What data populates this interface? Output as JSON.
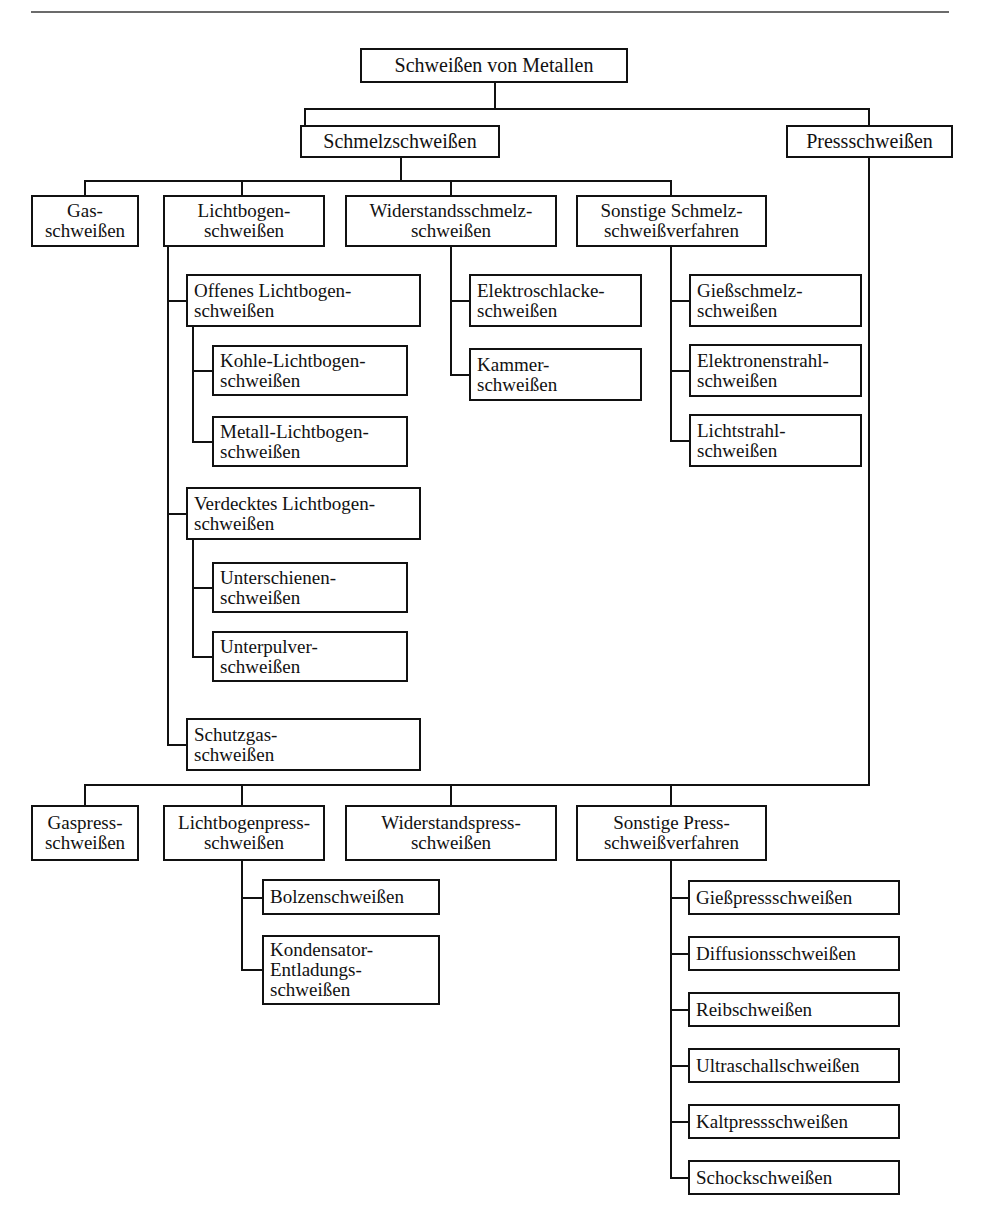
{
  "diagram": {
    "title_root": "Schweißen von Metallen",
    "type": "tree-hierarchy",
    "language": "de",
    "colors": {
      "line": "#111111",
      "box_border": "#111111",
      "background": "#ffffff",
      "rule": "#6b6b6b"
    },
    "nodes": {
      "root": {
        "label_lines": [
          "Schweißen von Metallen"
        ]
      },
      "schmelz": {
        "label_lines": [
          "Schmelzschweißen"
        ]
      },
      "press": {
        "label_lines": [
          "Pressschweißen"
        ]
      },
      "gas": {
        "label_lines": [
          "Gas-",
          "schweißen"
        ]
      },
      "lichtbogen": {
        "label_lines": [
          "Lichtbogen-",
          "schweißen"
        ]
      },
      "widerstandsschmelz": {
        "label_lines": [
          "Widerstandsschmelz-",
          "schweißen"
        ]
      },
      "sonstige_schmelz": {
        "label_lines": [
          "Sonstige Schmelz-",
          "schweißverfahren"
        ]
      },
      "offenes_lb": {
        "label_lines": [
          "Offenes Lichtbogen-",
          "schweißen"
        ]
      },
      "kohle_lb": {
        "label_lines": [
          "Kohle-Lichtbogen-",
          "schweißen"
        ]
      },
      "metall_lb": {
        "label_lines": [
          "Metall-Lichtbogen-",
          "schweißen"
        ]
      },
      "verdecktes_lb": {
        "label_lines": [
          "Verdecktes Lichtbogen-",
          "schweißen"
        ]
      },
      "unterschienen": {
        "label_lines": [
          "Unterschienen-",
          "schweißen"
        ]
      },
      "unterpulver": {
        "label_lines": [
          "Unterpulver-",
          "schweißen"
        ]
      },
      "schutzgas": {
        "label_lines": [
          "Schutzgas-",
          "schweißen"
        ]
      },
      "elektroschlacke": {
        "label_lines": [
          "Elektroschlacke-",
          "schweißen"
        ]
      },
      "kammer": {
        "label_lines": [
          "Kammer-",
          "schweißen"
        ]
      },
      "giessschmelz": {
        "label_lines": [
          "Gießschmelz-",
          "schweißen"
        ]
      },
      "elektronenstrahl": {
        "label_lines": [
          "Elektronenstrahl-",
          "schweißen"
        ]
      },
      "lichtstrahl": {
        "label_lines": [
          "Lichtstrahl-",
          "schweißen"
        ]
      },
      "gaspress": {
        "label_lines": [
          "Gaspress-",
          "schweißen"
        ]
      },
      "lichtbogenpress": {
        "label_lines": [
          "Lichtbogenpress-",
          "schweißen"
        ]
      },
      "widerstandspress": {
        "label_lines": [
          "Widerstandspress-",
          "schweißen"
        ]
      },
      "sonstige_press": {
        "label_lines": [
          "Sonstige Press-",
          "schweißverfahren"
        ]
      },
      "bolzen": {
        "label_lines": [
          "Bolzenschweißen"
        ]
      },
      "kondensator": {
        "label_lines": [
          "Kondensator-",
          "Entladungs-",
          "schweißen"
        ]
      },
      "giesspress": {
        "label_lines": [
          "Gießpressschweißen"
        ]
      },
      "diffusions": {
        "label_lines": [
          "Diffusionsschweißen"
        ]
      },
      "reib": {
        "label_lines": [
          "Reibschweißen"
        ]
      },
      "ultraschall": {
        "label_lines": [
          "Ultraschallschweißen"
        ]
      },
      "kaltpress": {
        "label_lines": [
          "Kaltpressschweißen"
        ]
      },
      "schock": {
        "label_lines": [
          "Schockschweißen"
        ]
      }
    }
  }
}
